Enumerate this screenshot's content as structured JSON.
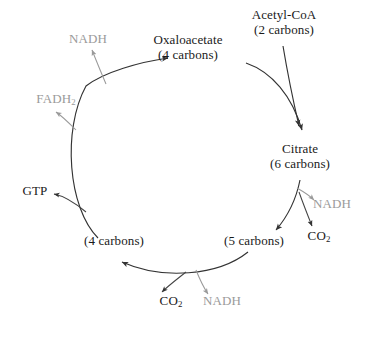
{
  "diagram": {
    "type": "cycle-diagram",
    "colors": {
      "background": "#ffffff",
      "primary_text": "#1a1a1a",
      "byproduct_text": "#9a9a9a",
      "arrow_primary": "#333333",
      "arrow_byproduct_gray": "#9a9a9a",
      "arrow_byproduct_dark": "#444444"
    },
    "nodes": [
      {
        "id": "oxaloacetate",
        "name": "Oxaloacetate",
        "carbons": "(4 carbons)",
        "color": "#1a1a1a"
      },
      {
        "id": "acetyl-coa",
        "name": "Acetyl-CoA",
        "carbons": "(2 carbons)",
        "color": "#1a1a1a"
      },
      {
        "id": "citrate",
        "name": "Citrate",
        "carbons": "(6 carbons)",
        "color": "#1a1a1a"
      },
      {
        "id": "five-carbons",
        "name": "",
        "carbons": "(5 carbons)",
        "color": "#1a1a1a"
      },
      {
        "id": "four-carbons",
        "name": "",
        "carbons": "(4 carbons)",
        "color": "#1a1a1a"
      }
    ],
    "byproducts": [
      {
        "id": "nadh-top",
        "label_html": "NADH",
        "label": "NADH",
        "color": "#9a9a9a"
      },
      {
        "id": "fadh2",
        "label_html": "FADH2",
        "label": "FADH2",
        "color": "#9a9a9a"
      },
      {
        "id": "gtp",
        "label_html": "GTP",
        "label": "GTP",
        "color": "#1a1a1a"
      },
      {
        "id": "nadh-right",
        "label_html": "NADH",
        "label": "NADH",
        "color": "#9a9a9a"
      },
      {
        "id": "co2-right",
        "label_html": "CO2",
        "label": "CO2",
        "color": "#1a1a1a"
      },
      {
        "id": "co2-bottom",
        "label_html": "CO2",
        "label": "CO2",
        "color": "#1a1a1a"
      },
      {
        "id": "nadh-bottom",
        "label_html": "NADH",
        "label": "NADH",
        "color": "#9a9a9a"
      }
    ],
    "labels": {
      "oxaloacetate_name": "Oxaloacetate",
      "oxaloacetate_carbons": "(4 carbons)",
      "acetyl_coa_name": "Acetyl-CoA",
      "acetyl_coa_carbons": "(2 carbons)",
      "citrate_name": "Citrate",
      "citrate_carbons": "(6 carbons)",
      "five_carbons": "(5 carbons)",
      "four_carbons": "(4 carbons)",
      "nadh_top": "NADH",
      "fadh2_base": "FADH",
      "fadh2_sub": "2",
      "gtp": "GTP",
      "nadh_right": "NADH",
      "co2_base": "CO",
      "co2_sub": "2",
      "co2_bottom_base": "CO",
      "co2_bottom_sub": "2",
      "nadh_bottom": "NADH"
    }
  }
}
